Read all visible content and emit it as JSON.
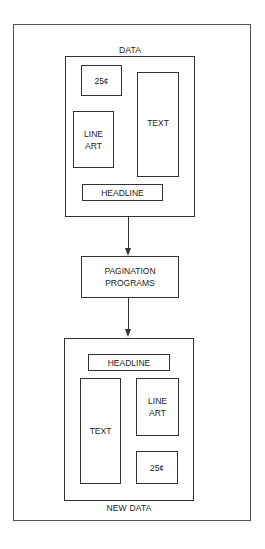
{
  "diagram": {
    "top_box": {
      "label": "DATA",
      "elements": {
        "price": "25¢",
        "text": "TEXT",
        "line_art_1": "LINE",
        "line_art_2": "ART",
        "headline": "HEADLINE"
      }
    },
    "process": {
      "line1": "PAGINATION",
      "line2": "PROGRAMS"
    },
    "bottom_box": {
      "label": "NEW DATA",
      "elements": {
        "headline": "HEADLINE",
        "text": "TEXT",
        "line_art_1": "LINE",
        "line_art_2": "ART",
        "price": "25¢"
      }
    }
  }
}
